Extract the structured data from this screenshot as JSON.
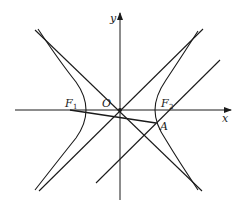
{
  "diagram": {
    "type": "hyperbola-with-asymptotes",
    "stroke_color": "#1a1a1a",
    "background": "#ffffff",
    "labels": {
      "x_axis": "x",
      "y_axis": "y",
      "origin": "O",
      "focus_left": "F",
      "focus_left_sub": "1",
      "focus_right": "F",
      "focus_right_sub": "2",
      "point_a": "A"
    },
    "elements": [
      {
        "name": "x-axis",
        "kind": "arrow-axis"
      },
      {
        "name": "y-axis",
        "kind": "arrow-axis"
      },
      {
        "name": "hyperbola",
        "kind": "curve",
        "branches": 2
      },
      {
        "name": "asymptote-1",
        "kind": "line",
        "through": "O"
      },
      {
        "name": "asymptote-2",
        "kind": "line",
        "through": "O"
      },
      {
        "name": "line-through-F2",
        "kind": "line",
        "parallel_to": "asymptote-1"
      },
      {
        "name": "segment-F1-A",
        "kind": "segment"
      }
    ]
  }
}
